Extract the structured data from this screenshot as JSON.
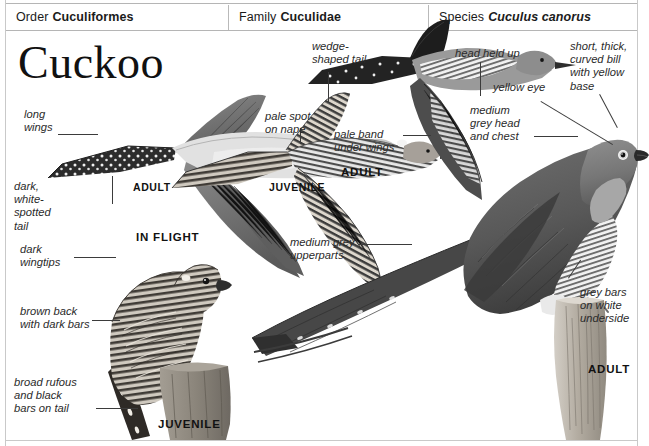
{
  "header": {
    "order": {
      "label": "Order",
      "value": "Cuculiformes"
    },
    "family": {
      "label": "Family",
      "value": "Cuculidae"
    },
    "species": {
      "label": "Species",
      "value": "Cuculus canorus"
    }
  },
  "title": "Cuckoo",
  "captions": {
    "in_flight": "IN FLIGHT",
    "adult_flight_left": "ADULT",
    "juvenile_flight": "JUVENILE",
    "adult_flight_top": "ADULT",
    "juvenile_perched": "JUVENILE",
    "adult_perched": "ADULT"
  },
  "annotations": {
    "long_wings": "long\nwings",
    "dark_white_spotted_tail": "dark,\nwhite-\nspotted\ntail",
    "dark_wingtips": "dark\nwingtips",
    "pale_spot_on_nape": "pale spot\non nape",
    "wedge_shaped_tail": "wedge-\nshaped tail",
    "pale_band_under_wings": "pale band\nunder wings",
    "head_held_up": "head held up",
    "yellow_eye": "yellow eye",
    "short_thick_curved_bill": "short, thick,\ncurved bill\nwith yellow\nbase",
    "medium_grey_head_and_chest": "medium\ngrey head\nand chest",
    "medium_grey_upperparts": "medium grey\nupperparts",
    "grey_bars_on_white_underside": "grey bars\non white\nunderside",
    "brown_back_with_dark_bars": "brown back\nwith dark bars",
    "broad_rufous_and_black_bars_on_tail": "broad rufous\nand black\nbars on tail"
  },
  "colors": {
    "frame": "#c9c9c9",
    "rule": "#b5b5b5",
    "text": "#1a1a1a",
    "leader": "#3b3b3b",
    "plumage_dark": "#4a4a4a",
    "plumage_mid": "#8c8c8c",
    "plumage_light": "#d8d8d8",
    "stump": "#b9b3aa"
  }
}
